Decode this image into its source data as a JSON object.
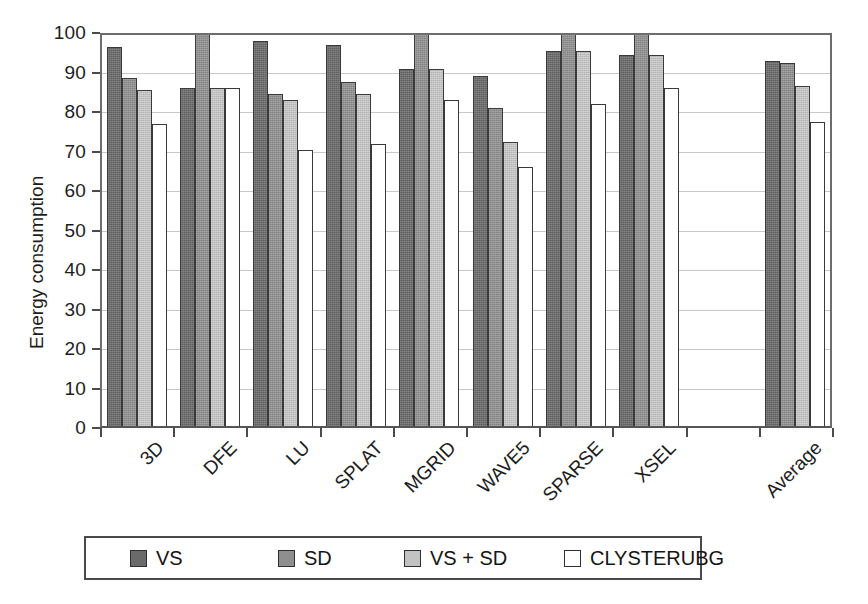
{
  "chart_data": {
    "type": "bar",
    "title": "",
    "xlabel": "",
    "ylabel": "Energy consumption",
    "ylim": [
      0,
      100
    ],
    "yticks": [
      0,
      10,
      20,
      30,
      40,
      50,
      60,
      70,
      80,
      90,
      100
    ],
    "grid": true,
    "legend_position": "bottom",
    "categories": [
      "3D",
      "DFE",
      "LU",
      "SPLAT",
      "MGRID",
      "WAVE5",
      "SPARSE",
      "XSEL",
      "",
      "Average"
    ],
    "series": [
      {
        "name": "VS",
        "color": "#6a6a6a",
        "values": [
          96.5,
          86.0,
          98.0,
          97.0,
          91.0,
          89.0,
          95.5,
          94.5,
          0,
          93.0
        ]
      },
      {
        "name": "SD",
        "color": "#8f8f8f",
        "values": [
          88.5,
          100.0,
          84.5,
          87.5,
          100.0,
          81.0,
          100.0,
          100.0,
          0,
          92.5
        ]
      },
      {
        "name": "VS + SD",
        "color": "#c2c2c2",
        "values": [
          85.5,
          86.0,
          83.0,
          84.5,
          91.0,
          72.5,
          95.5,
          94.5,
          0,
          86.5
        ]
      },
      {
        "name": "CLYSTERUBG",
        "color": "#ffffff",
        "values": [
          77.0,
          86.0,
          70.5,
          72.0,
          83.0,
          66.0,
          82.0,
          86.0,
          0,
          77.5
        ]
      }
    ]
  },
  "legend": {
    "items": [
      {
        "label": "VS"
      },
      {
        "label": "SD"
      },
      {
        "label": "VS + SD"
      },
      {
        "label": "CLYSTERUBG"
      }
    ]
  },
  "caption": {
    "text": ""
  }
}
